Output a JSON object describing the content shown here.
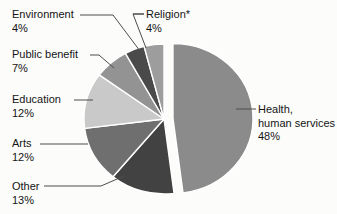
{
  "chart_data": {
    "type": "pie",
    "title": "",
    "legend_position": "none",
    "label_style": "callout-with-leader-lines",
    "start_angle_deg_from_top": 0,
    "direction": "clockwise",
    "total": 100,
    "leader_color": "#4d4d4d",
    "slice_separator_color": "#ffffff",
    "background_color": "#fcfcfa",
    "slices": [
      {
        "key": "health",
        "label_lines": [
          "Health,",
          "human services"
        ],
        "pct_label": "48%",
        "value": 48,
        "color": "#8b8b8b",
        "exploded": true,
        "label_pos": {
          "x": 258,
          "y": 103
        },
        "leader": [
          [
            236,
            109
          ],
          [
            256,
            109
          ]
        ]
      },
      {
        "key": "other",
        "label_lines": [
          "Other"
        ],
        "pct_label": "13%",
        "value": 13,
        "color": "#424242",
        "exploded": false,
        "label_pos": {
          "x": 12,
          "y": 180
        },
        "leader": [
          [
            44,
            186
          ],
          [
            101,
            186
          ],
          [
            124,
            176
          ]
        ]
      },
      {
        "key": "arts",
        "label_lines": [
          "Arts"
        ],
        "pct_label": "12%",
        "value": 12,
        "color": "#6f6f6f",
        "exploded": false,
        "label_pos": {
          "x": 12,
          "y": 137
        },
        "leader": [
          [
            40,
            144
          ],
          [
            88,
            144
          ]
        ]
      },
      {
        "key": "education",
        "label_lines": [
          "Education"
        ],
        "pct_label": "12%",
        "value": 12,
        "color": "#c9c9c9",
        "exploded": false,
        "label_pos": {
          "x": 12,
          "y": 93
        },
        "leader": [
          [
            74,
            100
          ],
          [
            93,
            100
          ]
        ]
      },
      {
        "key": "public-benefit",
        "label_lines": [
          "Public benefit"
        ],
        "pct_label": "7%",
        "value": 7,
        "color": "#939393",
        "exploded": false,
        "label_pos": {
          "x": 12,
          "y": 48
        },
        "leader": [
          [
            90,
            55
          ],
          [
            99,
            55
          ],
          [
            114,
            68
          ]
        ]
      },
      {
        "key": "environment",
        "label_lines": [
          "Environment"
        ],
        "pct_label": "4%",
        "value": 4,
        "color": "#4a4a4a",
        "exploded": false,
        "label_pos": {
          "x": 12,
          "y": 8
        },
        "leader": [
          [
            80,
            15
          ],
          [
            113,
            15
          ],
          [
            140,
            51
          ]
        ]
      },
      {
        "key": "religion",
        "label_lines": [
          "Religion*"
        ],
        "pct_label": "4%",
        "value": 4,
        "color": "#9d9d9d",
        "exploded": false,
        "label_pos": {
          "x": 146,
          "y": 8
        },
        "leader": [
          [
            133,
            14
          ],
          [
            144,
            14
          ],
          [
            133,
            14
          ],
          [
            146,
            48
          ]
        ]
      }
    ]
  }
}
